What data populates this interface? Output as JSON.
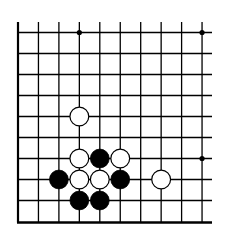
{
  "diagram": {
    "type": "go-board-fragment",
    "columns": 10,
    "rows": 10,
    "edges": {
      "left": true,
      "bottom": true,
      "top": false,
      "right": false
    },
    "colors": {
      "background": "#ffffff",
      "line": "#000000",
      "black_stone": "#000000",
      "white_stone": "#ffffff"
    },
    "star_points": [
      {
        "col": 3,
        "row": 0
      },
      {
        "col": 9,
        "row": 0
      },
      {
        "col": 9,
        "row": 6
      }
    ],
    "stones": [
      {
        "color": "white",
        "col": 3,
        "row": 4
      },
      {
        "color": "white",
        "col": 3,
        "row": 6
      },
      {
        "color": "black",
        "col": 4,
        "row": 6
      },
      {
        "color": "white",
        "col": 5,
        "row": 6
      },
      {
        "color": "black",
        "col": 2,
        "row": 7
      },
      {
        "color": "white",
        "col": 3,
        "row": 7
      },
      {
        "color": "white",
        "col": 4,
        "row": 7
      },
      {
        "color": "black",
        "col": 5,
        "row": 7
      },
      {
        "color": "white",
        "col": 7,
        "row": 7
      },
      {
        "color": "black",
        "col": 3,
        "row": 8
      },
      {
        "color": "black",
        "col": 4,
        "row": 8
      }
    ]
  }
}
